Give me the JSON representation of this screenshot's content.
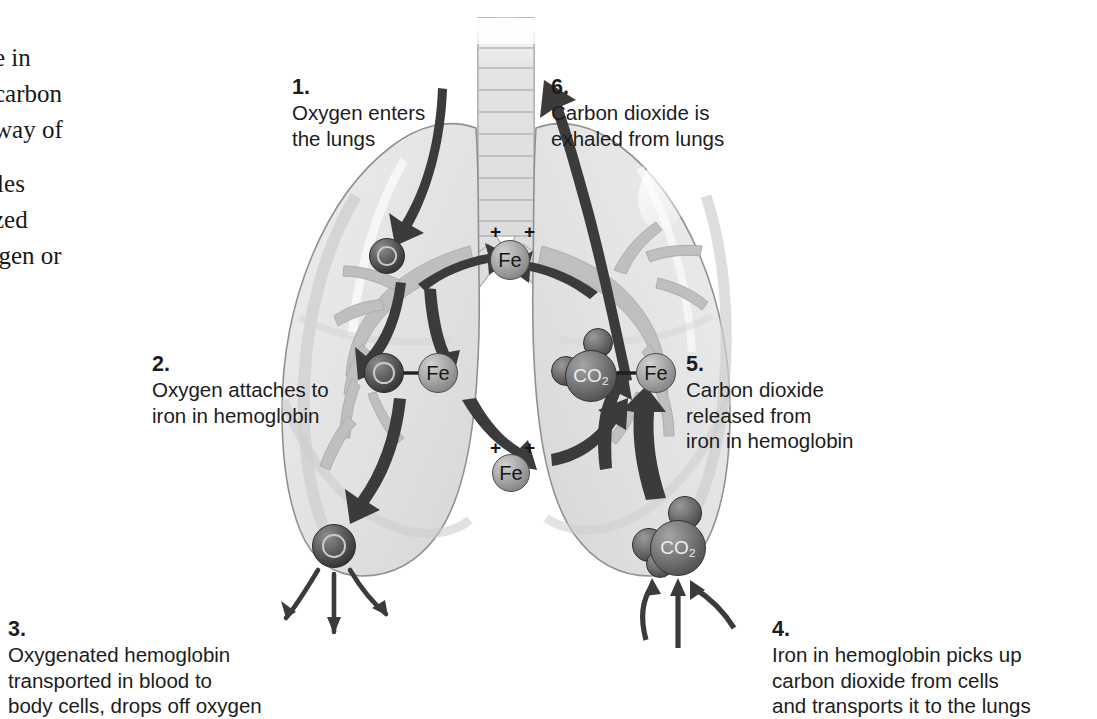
{
  "figure": {
    "background_color": "#ffffff"
  },
  "body_column": {
    "fragment_lines_top": [
      "e in",
      "carbon",
      "way of"
    ],
    "fragment_lines_bottom": [
      "cles",
      "ized",
      "ygen or"
    ]
  },
  "steps": [
    {
      "number": "1.",
      "lines": "Oxygen enters\nthe lungs",
      "name": "step-1"
    },
    {
      "number": "2.",
      "lines": "Oxygen attaches to\niron in hemoglobin",
      "name": "step-2"
    },
    {
      "number": "3.",
      "lines": "Oxygenated hemoglobin\ntransported in blood to\nbody cells, drops off oxygen",
      "name": "step-3"
    },
    {
      "number": "4.",
      "lines": "Iron in hemoglobin picks up\ncarbon dioxide from cells\nand transports it to the lungs",
      "name": "step-4"
    },
    {
      "number": "5.",
      "lines": "Carbon dioxide\nreleased from\niron in hemoglobin",
      "name": "step-5"
    },
    {
      "number": "6.",
      "lines": "Carbon dioxide is\nexhaled from lungs",
      "name": "step-6"
    }
  ],
  "molecules": {
    "oxygen_upper": "O",
    "oxygen_bound": "O",
    "oxygen_lower": "O",
    "iron_upper": "Fe",
    "iron_bound_left": "Fe",
    "iron_middle": "Fe",
    "iron_bound_right": "Fe",
    "co2_bound": "CO",
    "co2_subscript": "2",
    "co2_lower": "CO",
    "charge_sign": "+"
  },
  "anatomy": {
    "trachea_label": "trachea",
    "left_lung_label": "left lung",
    "right_lung_label": "right lung",
    "bronchi_label": "bronchial tree"
  },
  "colors": {
    "lung_fill": "#e6e6e6",
    "lung_fill_shade": "#d8d8d8",
    "lung_outline": "#8f8f8f",
    "airway": "#c6c6c6",
    "arrow_dark": "#3a3a3a",
    "text": "#1c1c1c",
    "page": "#ffffff"
  }
}
